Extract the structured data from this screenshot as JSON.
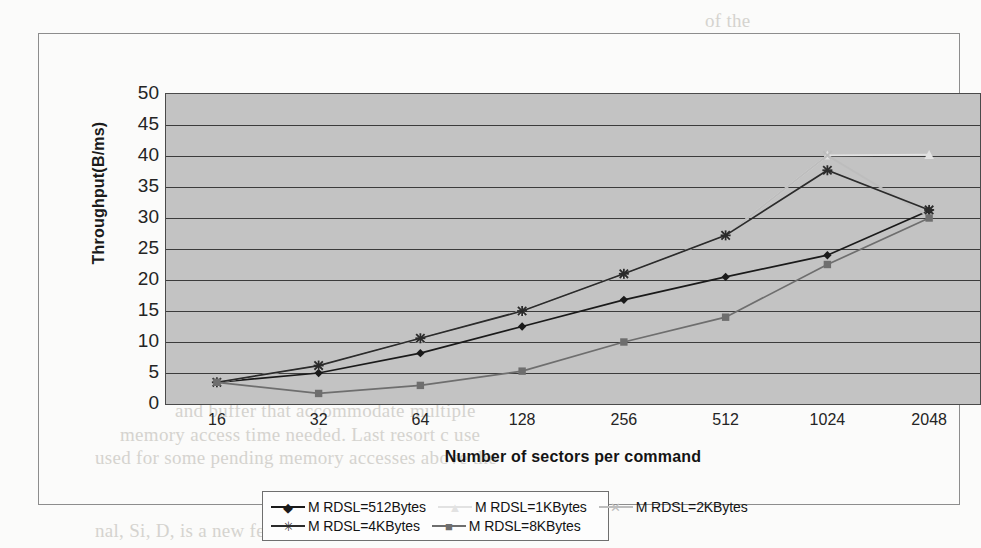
{
  "figure": {
    "background_scan_text": {
      "top": "of the",
      "l1": "and buffer that accommodate multiple",
      "l2": "memory access time needed. Last resort c use",
      "l3": "used for some pending memory accesses above the",
      "l4": "nal, Si, D, is a new feature of the application. The SCSI"
    }
  },
  "chart_data": {
    "type": "line",
    "title": "",
    "xlabel": "Number of sectors per command",
    "ylabel": "Throughput(B/ms)",
    "x_scale": "category",
    "categories": [
      "16",
      "32",
      "64",
      "128",
      "256",
      "512",
      "1024",
      "2048"
    ],
    "ylim": [
      0,
      50
    ],
    "ytick_step": 5,
    "yticks": [
      "0",
      "5",
      "10",
      "15",
      "20",
      "25",
      "30",
      "35",
      "40",
      "45",
      "50"
    ],
    "grid": "horizontal",
    "legend_position": "bottom",
    "plot_bg_color": "#c3c3c3",
    "series": [
      {
        "name": "M RDSL=512Bytes",
        "marker": "diamond",
        "color": "#1a1a1a",
        "values": [
          3.5,
          5.0,
          8.2,
          12.5,
          16.8,
          20.5,
          24.0,
          31.2
        ]
      },
      {
        "name": "M RDSL=1KBytes",
        "marker": "triangle",
        "color": "#e2e2e2",
        "values": [
          3.5,
          6.2,
          10.6,
          15.0,
          21.0,
          27.2,
          40.1,
          40.2
        ]
      },
      {
        "name": "M RDSL=2KBytes",
        "marker": "x",
        "color": "#bdbdbd",
        "values": [
          3.5,
          6.2,
          10.6,
          15.0,
          21.0,
          27.2,
          40.1,
          30.2
        ]
      },
      {
        "name": "M RDSL=4KBytes",
        "marker": "star",
        "color": "#2b2b2b",
        "values": [
          3.5,
          6.2,
          10.6,
          15.0,
          21.0,
          27.2,
          37.7,
          31.3
        ]
      },
      {
        "name": "M RDSL=8KBytes",
        "marker": "square",
        "color": "#6e6e6e",
        "values": [
          3.5,
          1.7,
          3.0,
          5.3,
          10.0,
          14.0,
          22.5,
          30.0
        ]
      }
    ]
  }
}
